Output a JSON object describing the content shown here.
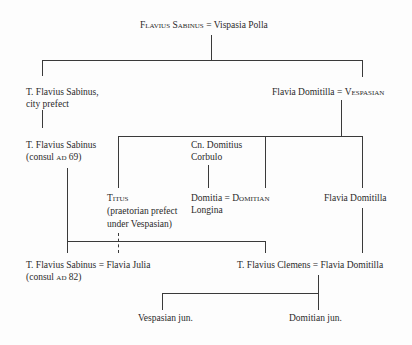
{
  "diagram": {
    "type": "family-tree",
    "generation_0": {
      "husband": "Flavius Sabinus",
      "eq": "=",
      "wife": "Vispasia Polla"
    },
    "generation_1": {
      "left": {
        "line1": "T. Flavius Sabinus,",
        "line2": "city prefect"
      },
      "right": {
        "wife": "Flavia Domitilla",
        "eq": "=",
        "husband": "Vespasian"
      }
    },
    "generation_2": {
      "sabinus": {
        "line1": "T. Flavius Sabinus",
        "line2_prefix": "(consul ",
        "line2_era": "AD",
        "line2_suffix": " 69)"
      },
      "corbulo": {
        "line1": "Cn. Domitius",
        "line2": "Corbulo"
      },
      "titus": {
        "name": "Titus",
        "line2": "(praetorian prefect",
        "line3": "under Vespasian)"
      },
      "domitia": {
        "wife_line1": "Domitia",
        "eq": "=",
        "husband": "Domitian",
        "wife_line2": "Longina"
      },
      "domitilla": {
        "name": "Flavia Domitilla"
      }
    },
    "generation_3": {
      "left": {
        "husband": "T. Flavius Sabinus",
        "eq": "=",
        "wife": "Flavia Julia",
        "line2_prefix": "(consul ",
        "line2_era": "AD",
        "line2_suffix": " 82)"
      },
      "right": {
        "husband": "T. Flavius Clemens",
        "eq": "=",
        "wife": "Flavia Domitilla"
      }
    },
    "generation_4": {
      "left": "Vespasian jun.",
      "right": "Domitian jun."
    }
  }
}
